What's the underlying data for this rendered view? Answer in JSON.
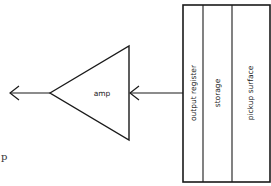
{
  "diagram": {
    "amplifier": {
      "label": "amp"
    },
    "sensor_regions": [
      {
        "label": "output register"
      },
      {
        "label": "storage"
      },
      {
        "label": "pickup surface"
      }
    ],
    "stray_text": "p",
    "colors": {
      "stroke": "#1a1a1a",
      "background": "#ffffff"
    }
  }
}
